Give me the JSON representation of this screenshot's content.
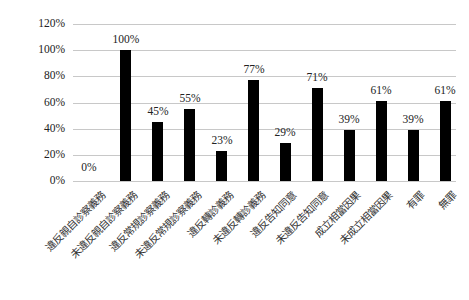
{
  "chart_data": {
    "type": "bar",
    "title": "",
    "xlabel": "",
    "ylabel": "",
    "ylim": [
      0,
      120
    ],
    "y_ticks": [
      "0%",
      "20%",
      "40%",
      "60%",
      "80%",
      "100%",
      "120%"
    ],
    "grid": true,
    "legend": null,
    "categories": [
      "違反親自診察義務",
      "未違反親自診察義務",
      "違反常規診察義務",
      "未違反常規診察義務",
      "違反轉診義務",
      "未違反轉診義務",
      "違反告知同意",
      "未違反告知同意",
      "成立相當因果",
      "未成立相當因果",
      "有罪",
      "無罪"
    ],
    "values": [
      0,
      100,
      45,
      55,
      23,
      77,
      29,
      71,
      39,
      61,
      39,
      61
    ],
    "data_labels": [
      "0%",
      "100%",
      "45%",
      "55%",
      "23%",
      "77%",
      "29%",
      "71%",
      "39%",
      "61%",
      "39%",
      "61%"
    ],
    "bar_color": "#000000",
    "grid_color": "#c8c8c8"
  }
}
